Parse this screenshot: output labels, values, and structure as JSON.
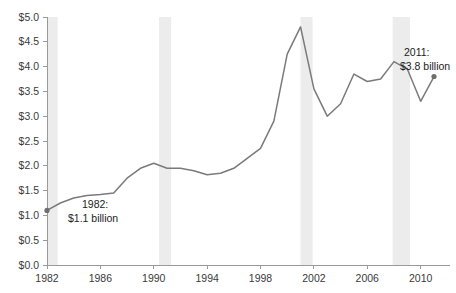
{
  "chart_data": {
    "type": "line",
    "title": "",
    "subtitle": "",
    "xlabel": "",
    "ylabel": "",
    "xlim": [
      1982,
      2011
    ],
    "ylim": [
      0.0,
      5.0
    ],
    "grid": false,
    "legend": "none",
    "value_prefix": "$",
    "value_unit": "billion",
    "y_ticks": [
      "$0.0",
      "$0.5",
      "$1.0",
      "$1.5",
      "$2.0",
      "$2.5",
      "$3.0",
      "$3.5",
      "$4.0",
      "$4.5",
      "$5.0"
    ],
    "y_tick_values": [
      0.0,
      0.5,
      1.0,
      1.5,
      2.0,
      2.5,
      3.0,
      3.5,
      4.0,
      4.5,
      5.0
    ],
    "x_ticks": [
      "1982",
      "1986",
      "1990",
      "1994",
      "1998",
      "2002",
      "2006",
      "2010"
    ],
    "x_tick_values": [
      1982,
      1986,
      1990,
      1994,
      1998,
      2002,
      2006,
      2010
    ],
    "x": [
      1982,
      1983,
      1984,
      1985,
      1986,
      1987,
      1988,
      1989,
      1990,
      1991,
      1992,
      1993,
      1994,
      1995,
      1996,
      1997,
      1998,
      1999,
      2000,
      2001,
      2002,
      2003,
      2004,
      2005,
      2006,
      2007,
      2008,
      2009,
      2010,
      2011
    ],
    "values": [
      1.1,
      1.25,
      1.35,
      1.4,
      1.42,
      1.45,
      1.75,
      1.95,
      2.05,
      1.95,
      1.95,
      1.9,
      1.82,
      1.85,
      1.95,
      2.15,
      2.35,
      2.9,
      4.25,
      4.8,
      3.55,
      3.0,
      3.25,
      3.85,
      3.7,
      3.75,
      4.1,
      3.95,
      3.3,
      3.8
    ],
    "series": [
      {
        "name": "Annual amount",
        "values": [
          1.1,
          1.25,
          1.35,
          1.4,
          1.42,
          1.45,
          1.75,
          1.95,
          2.05,
          1.95,
          1.95,
          1.9,
          1.82,
          1.85,
          1.95,
          2.15,
          2.35,
          2.9,
          4.25,
          4.8,
          3.55,
          3.0,
          3.25,
          3.85,
          3.7,
          3.75,
          4.1,
          3.95,
          3.3,
          3.8
        ],
        "color": "#7a7a7a"
      }
    ],
    "recession_bands": [
      {
        "start": 1982.0,
        "end": 1982.8
      },
      {
        "start": 1990.4,
        "end": 1991.3
      },
      {
        "start": 2001.0,
        "end": 2001.9
      },
      {
        "start": 2007.9,
        "end": 2009.2
      }
    ],
    "band_color": "#ececec",
    "markers": [
      {
        "x": 1982,
        "y": 1.1
      },
      {
        "x": 2011,
        "y": 3.8
      }
    ],
    "annotations": [
      {
        "name": "start-annotation",
        "line1": "1982:",
        "line2": "$1.1 billion",
        "x": 1982,
        "y": 1.1
      },
      {
        "name": "end-annotation",
        "line1": "2011:",
        "line2": "$3.8 billion",
        "x": 2011,
        "y": 3.8
      }
    ]
  }
}
